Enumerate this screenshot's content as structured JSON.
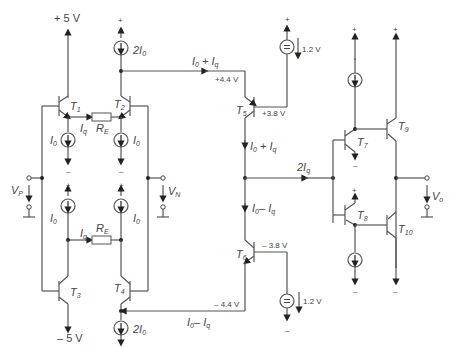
{
  "supplies": {
    "top_left": "+ 5 V",
    "bottom_left": "– 5 V",
    "plus": "+",
    "minus": "–"
  },
  "transistors": {
    "t1": "T1",
    "t2": "T2",
    "t3": "T3",
    "t4": "T4",
    "t5": "T5",
    "t6": "T6",
    "t7": "T7",
    "t8": "T8",
    "t9": "T9",
    "t10": "T10"
  },
  "sources": {
    "top_2i0": "2I0",
    "bottom_2i0": "2I0",
    "i0_t1": "I0",
    "i0_t2": "I0",
    "i0_t3": "I0",
    "i0_t4": "I0",
    "vref_top": "1.2 V",
    "vref_bottom": "1.2 V"
  },
  "resistors": {
    "re_top": "RE",
    "re_bottom": "RE"
  },
  "currents": {
    "iq_top": "Iq",
    "iq_bottom": "Iq",
    "top_branch": "I0 + Iq",
    "bottom_branch": "I0 – Iq",
    "t5_down": "I0 + Iq",
    "t6_up": "I0 – Iq",
    "out_2iq": "2Iq"
  },
  "voltages": {
    "node_top": "+4.4 V",
    "t5_base": "+3.8 V",
    "t6_base": "– 3.8 V",
    "node_bottom": "– 4.4 V",
    "vp": "VP",
    "vn": "VN",
    "vo": "Vo"
  }
}
